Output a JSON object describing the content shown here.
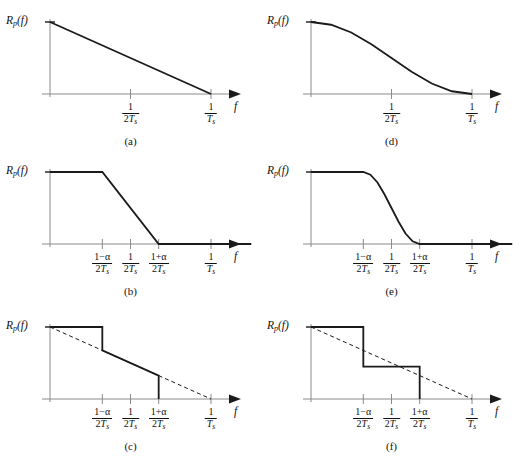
{
  "figure": {
    "axis_label_y": "R",
    "axis_label_y_sub": "p",
    "axis_label_y_arg": "(f)",
    "axis_label_x": "f",
    "line_color": "#1a1a1a",
    "axis_color": "#8a8a8a",
    "background": "#ffffff"
  },
  "ticks": {
    "half_rate": {
      "num": "1",
      "den_pre": "2",
      "den_var": "T",
      "den_sub": "s"
    },
    "full_rate": {
      "num": "1",
      "den_pre": "",
      "den_var": "T",
      "den_sub": "s"
    },
    "lower_edge": {
      "num": "1−α",
      "den_pre": "2",
      "den_var": "T",
      "den_sub": "s"
    },
    "upper_edge": {
      "num": "1+α",
      "den_pre": "2",
      "den_var": "T",
      "den_sub": "s"
    }
  },
  "panels": [
    {
      "id": "a",
      "caption": "(a)",
      "tick_labels": [
        "half_rate",
        "full_rate"
      ],
      "description": "Linear triangular rolloff from peak at f=0 to zero at 1/Ts"
    },
    {
      "id": "b",
      "caption": "(b)",
      "tick_labels": [
        "lower_edge",
        "half_rate",
        "upper_edge",
        "full_rate"
      ],
      "description": "Flat passband then linear rolloff between (1-a)/2Ts and (1+a)/2Ts"
    },
    {
      "id": "c",
      "caption": "(c)",
      "tick_labels": [
        "lower_edge",
        "half_rate",
        "upper_edge",
        "full_rate"
      ],
      "description": "Flat top with step down at (1-a)/2Ts onto dashed triangle, sloping then dropping to zero at (1+a)/2Ts"
    },
    {
      "id": "d",
      "caption": "(d)",
      "tick_labels": [
        "half_rate",
        "full_rate"
      ],
      "description": "Smooth raised-cosine curve from peak at f=0 to zero at 1/Ts"
    },
    {
      "id": "e",
      "caption": "(e)",
      "tick_labels": [
        "lower_edge",
        "half_rate",
        "upper_edge",
        "full_rate"
      ],
      "description": "Flat passband then cosine rolloff reaching zero at (1+a)/2Ts"
    },
    {
      "id": "f",
      "caption": "(f)",
      "tick_labels": [
        "lower_edge",
        "half_rate",
        "upper_edge",
        "full_rate"
      ],
      "description": "Two-level staircase approximation with dashed triangle reference line"
    }
  ],
  "chart_data": {
    "type": "line",
    "xlabel": "f",
    "ylabel": "R_p(f)",
    "shared": {
      "x_tick_values": [
        0.0,
        0.5,
        1.0
      ],
      "alpha": 0.35,
      "ylim": [
        0,
        1
      ],
      "grid": false,
      "legend": false
    },
    "charts": [
      {
        "id": "a",
        "caption": "(a)",
        "type": "line",
        "x_tick_labels": [
          "1/(2Ts)",
          "1/Ts"
        ],
        "x_tick_positions": [
          0.5,
          1.0
        ],
        "xlim": [
          0,
          1.25
        ],
        "ylim": [
          0,
          1
        ],
        "series": [
          {
            "name": "triangular",
            "style": "solid",
            "x": [
              0.0,
              1.0
            ],
            "values": [
              1.0,
              0.0
            ]
          }
        ]
      },
      {
        "id": "b",
        "caption": "(b)",
        "type": "line",
        "x_tick_labels": [
          "(1-α)/(2Ts)",
          "1/(2Ts)",
          "(1+α)/(2Ts)",
          "1/Ts"
        ],
        "x_tick_positions": [
          0.325,
          0.5,
          0.675,
          1.0
        ],
        "xlim": [
          0,
          1.25
        ],
        "ylim": [
          0,
          1
        ],
        "series": [
          {
            "name": "trapezoidal",
            "style": "solid",
            "x": [
              0.0,
              0.325,
              0.675,
              1.25
            ],
            "values": [
              1.0,
              1.0,
              0.0,
              0.0
            ]
          }
        ]
      },
      {
        "id": "c",
        "caption": "(c)",
        "type": "line",
        "x_tick_labels": [
          "(1-α)/(2Ts)",
          "1/(2Ts)",
          "(1+α)/(2Ts)",
          "1/Ts"
        ],
        "x_tick_positions": [
          0.325,
          0.5,
          0.675,
          1.0
        ],
        "xlim": [
          0,
          1.25
        ],
        "ylim": [
          0,
          1
        ],
        "series": [
          {
            "name": "stepped-triangular",
            "style": "solid",
            "x": [
              0.0,
              0.325,
              0.325,
              0.675,
              0.675
            ],
            "values": [
              1.0,
              1.0,
              0.675,
              0.325,
              0.0
            ]
          },
          {
            "name": "reference-triangle",
            "style": "dashed",
            "x": [
              0.0,
              1.0
            ],
            "values": [
              1.0,
              0.0
            ]
          }
        ]
      },
      {
        "id": "d",
        "caption": "(d)",
        "type": "line",
        "x_tick_labels": [
          "1/(2Ts)",
          "1/Ts"
        ],
        "x_tick_positions": [
          0.5,
          1.0
        ],
        "xlim": [
          0,
          1.25
        ],
        "ylim": [
          0,
          1
        ],
        "series": [
          {
            "name": "raised-cosine",
            "style": "solid",
            "x": [
              0.0,
              0.125,
              0.25,
              0.375,
              0.5,
              0.625,
              0.75,
              0.875,
              1.0
            ],
            "values": [
              1.0,
              0.962,
              0.854,
              0.691,
              0.5,
              0.309,
              0.146,
              0.038,
              0.0
            ]
          }
        ]
      },
      {
        "id": "e",
        "caption": "(e)",
        "type": "line",
        "x_tick_labels": [
          "(1-α)/(2Ts)",
          "1/(2Ts)",
          "(1+α)/(2Ts)",
          "1/Ts"
        ],
        "x_tick_positions": [
          0.325,
          0.5,
          0.675,
          1.0
        ],
        "xlim": [
          0,
          1.25
        ],
        "ylim": [
          0,
          1
        ],
        "series": [
          {
            "name": "raised-cosine-rolloff",
            "style": "solid",
            "x": [
              0.0,
              0.325,
              0.369,
              0.413,
              0.456,
              0.5,
              0.544,
              0.587,
              0.631,
              0.675,
              1.25
            ],
            "values": [
              1.0,
              1.0,
              0.962,
              0.854,
              0.691,
              0.5,
              0.309,
              0.146,
              0.038,
              0.0,
              0.0
            ]
          }
        ]
      },
      {
        "id": "f",
        "caption": "(f)",
        "type": "line",
        "x_tick_labels": [
          "(1-α)/(2Ts)",
          "1/(2Ts)",
          "(1+α)/(2Ts)",
          "1/Ts"
        ],
        "x_tick_positions": [
          0.325,
          0.5,
          0.675,
          1.0
        ],
        "xlim": [
          0,
          1.25
        ],
        "ylim": [
          0,
          1
        ],
        "series": [
          {
            "name": "two-level-staircase",
            "style": "solid",
            "x": [
              0.0,
              0.325,
              0.325,
              0.675,
              0.675
            ],
            "values": [
              1.0,
              1.0,
              0.45,
              0.45,
              0.0
            ]
          },
          {
            "name": "reference-triangle",
            "style": "dashed",
            "x": [
              0.0,
              1.0
            ],
            "values": [
              1.0,
              0.0
            ]
          }
        ]
      }
    ]
  }
}
